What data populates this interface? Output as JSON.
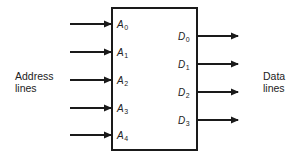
{
  "diagram": {
    "type": "memory-block",
    "left_label": {
      "line1": "Address",
      "line2": "lines"
    },
    "right_label": {
      "line1": "Data",
      "line2": "lines"
    },
    "inputs": [
      {
        "letter": "A",
        "index": "0"
      },
      {
        "letter": "A",
        "index": "1"
      },
      {
        "letter": "A",
        "index": "2"
      },
      {
        "letter": "A",
        "index": "3"
      },
      {
        "letter": "A",
        "index": "4"
      }
    ],
    "outputs": [
      {
        "letter": "D",
        "index": "0"
      },
      {
        "letter": "D",
        "index": "1"
      },
      {
        "letter": "D",
        "index": "2"
      },
      {
        "letter": "D",
        "index": "3"
      }
    ],
    "colors": {
      "stroke": "#1a1a1a",
      "background": "#ffffff"
    }
  }
}
